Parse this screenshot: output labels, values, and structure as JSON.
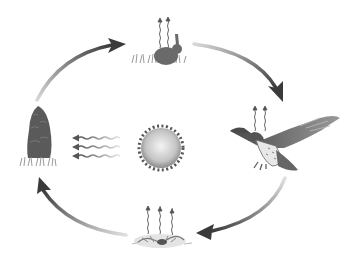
{
  "diagram": {
    "type": "energy-cycle",
    "center": {
      "name": "sun",
      "icon": "sun-icon"
    },
    "nodes": [
      {
        "id": "rabbit",
        "label": "",
        "icon": "rabbit-icon",
        "heat_arrows": 2
      },
      {
        "id": "hawk",
        "label": "",
        "icon": "hawk-icon",
        "heat_arrows": 2
      },
      {
        "id": "decomposers",
        "label": "",
        "icon": "decomposer-icon",
        "heat_arrows": 3
      },
      {
        "id": "tree",
        "label": "",
        "icon": "tree-icon",
        "heat_arrows": 0
      }
    ],
    "cycle_arrows": [
      {
        "from": "tree",
        "to": "rabbit"
      },
      {
        "from": "rabbit",
        "to": "hawk"
      },
      {
        "from": "hawk",
        "to": "decomposers"
      },
      {
        "from": "decomposers",
        "to": "tree"
      }
    ],
    "sunlight_arrows": {
      "from": "sun",
      "to": "tree",
      "count": 3
    },
    "colors": {
      "background": "#ffffff",
      "arrow_dark": "#3a3a3a",
      "arrow_light": "#cfcfcf",
      "sun_center": "#f2f2f2",
      "sun_edge": "#8a8a8a",
      "tree": "#5a5a5a",
      "grass": "#9a9a9a"
    }
  }
}
